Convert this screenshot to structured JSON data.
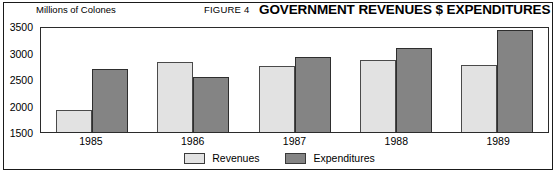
{
  "figure": {
    "figure_number": "FIGURE 4",
    "title": "GOVERNMENT REVENUES $ EXPENDITURES",
    "unit_label": "Millions of Colones"
  },
  "chart_data": {
    "type": "bar",
    "title": "GOVERNMENT REVENUES $ EXPENDITURES",
    "xlabel": "",
    "ylabel": "Millions of Colones",
    "categories": [
      "1985",
      "1986",
      "1987",
      "1988",
      "1989"
    ],
    "series": [
      {
        "name": "Revenues",
        "color": "#e2e2e2",
        "values": [
          1910,
          2830,
          2740,
          2850,
          2760
        ]
      },
      {
        "name": "Expenditures",
        "color": "#848484",
        "values": [
          2690,
          2540,
          2920,
          3080,
          3420
        ]
      }
    ],
    "ylim": [
      1500,
      3500
    ],
    "yticks": [
      "3500",
      "3000",
      "2500",
      "2000",
      "1500"
    ],
    "ytick_values": [
      3500,
      3000,
      2500,
      2000,
      1500
    ],
    "grid": false,
    "legend_position": "bottom-center"
  },
  "legend": {
    "items": [
      {
        "label": "Revenues"
      },
      {
        "label": "Expenditures"
      }
    ]
  }
}
